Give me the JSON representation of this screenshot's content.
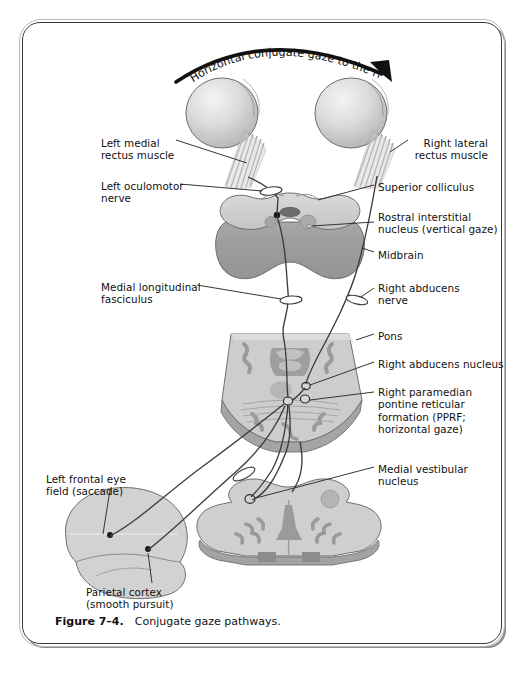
{
  "figure": {
    "caption_number": "Figure 7–4.",
    "caption_text": "Conjugate gaze pathways.",
    "arc_title": "Horizontal conjugate gaze to the right"
  },
  "labels_left": [
    {
      "id": "left-medial-rectus-muscle",
      "text": "Left medial\nrectus muscle",
      "x": 101,
      "y": 137
    },
    {
      "id": "left-oculomotor-nerve",
      "text": "Left oculomotor\nnerve",
      "x": 101,
      "y": 180
    },
    {
      "id": "medial-longitudinal-fasciculus",
      "text": "Medial longitudinal\nfasciculus",
      "x": 101,
      "y": 281
    },
    {
      "id": "left-frontal-eye-field",
      "text": "Left frontal eye\nfield (saccade)",
      "x": 46,
      "y": 473
    },
    {
      "id": "parietal-cortex",
      "text": "Parietal cortex\n(smooth pursuit)",
      "x": 86,
      "y": 586
    }
  ],
  "labels_right": [
    {
      "id": "right-lateral-rectus-muscle",
      "text": "Right lateral\nrectus muscle",
      "x": 412,
      "y": 137,
      "align": "left"
    },
    {
      "id": "superior-colliculus",
      "text": "Superior colliculus",
      "x": 378,
      "y": 181,
      "align": "left"
    },
    {
      "id": "rostral-interstitial-nucleus",
      "text": "Rostral interstitial\nnucleus (vertical gaze)",
      "x": 378,
      "y": 211,
      "align": "left"
    },
    {
      "id": "midbrain",
      "text": "Midbrain",
      "x": 378,
      "y": 249,
      "align": "left"
    },
    {
      "id": "right-abducens-nerve",
      "text": "Right abducens\nnerve",
      "x": 378,
      "y": 282,
      "align": "left"
    },
    {
      "id": "pons",
      "text": "Pons",
      "x": 378,
      "y": 330,
      "align": "left"
    },
    {
      "id": "right-abducens-nucleus",
      "text": "Right abducens nucleus",
      "x": 378,
      "y": 358,
      "align": "left"
    },
    {
      "id": "right-pprf",
      "text": "Right paramedian\npontine reticular\nformation (PPRF;\nhorizontal gaze)",
      "x": 378,
      "y": 386,
      "align": "left"
    },
    {
      "id": "medial-vestibular-nucleus",
      "text": "Medial vestibular\nnucleus",
      "x": 378,
      "y": 463,
      "align": "left"
    }
  ],
  "structures": [
    {
      "id": "left-eye",
      "name": "Left eyeball"
    },
    {
      "id": "right-eye",
      "name": "Right eyeball"
    },
    {
      "id": "midbrain-section",
      "name": "Midbrain cross-section"
    },
    {
      "id": "pons-section",
      "name": "Pons cross-section"
    },
    {
      "id": "medulla-section",
      "name": "Medulla cross-section"
    },
    {
      "id": "cerebral-cortex",
      "name": "Left cerebral hemisphere"
    }
  ],
  "colors": {
    "frame": "#3a3a3a",
    "tissue_light": "#d3d3d3",
    "tissue_mid": "#b6b6b6",
    "tissue_dark": "#9a9a9a",
    "tissue_darker": "#818181",
    "outline": "#4a4a4a",
    "pathway": "#3c3c3c",
    "text": "#111111"
  }
}
